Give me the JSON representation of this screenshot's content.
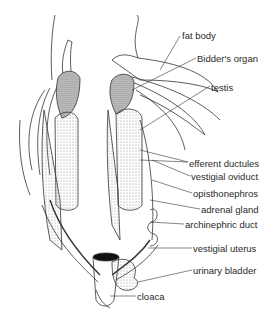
{
  "diagram": {
    "labels": [
      {
        "id": "fat-body",
        "text": "fat body",
        "x": 182,
        "y": 31
      },
      {
        "id": "bidders-organ",
        "text": "Bidder's organ",
        "x": 197,
        "y": 54
      },
      {
        "id": "testis",
        "text": "testis",
        "x": 211,
        "y": 83
      },
      {
        "id": "efferent-ductules",
        "text": "efferent ductules",
        "x": 189,
        "y": 159
      },
      {
        "id": "vestigial-oviduct",
        "text": "vestigial oviduct",
        "x": 191,
        "y": 172
      },
      {
        "id": "opisthonephros",
        "text": "opisthonephros",
        "x": 193,
        "y": 189
      },
      {
        "id": "adrenal-gland",
        "text": "adrenal gland",
        "x": 201,
        "y": 205
      },
      {
        "id": "archinephric-duct",
        "text": "archinephric duct",
        "x": 185,
        "y": 220
      },
      {
        "id": "vestigial-uterus",
        "text": "vestigial uterus",
        "x": 193,
        "y": 244
      },
      {
        "id": "urinary-bladder",
        "text": "urinary bladder",
        "x": 193,
        "y": 266
      },
      {
        "id": "cloaca",
        "text": "cloaca",
        "x": 137,
        "y": 292
      }
    ]
  }
}
